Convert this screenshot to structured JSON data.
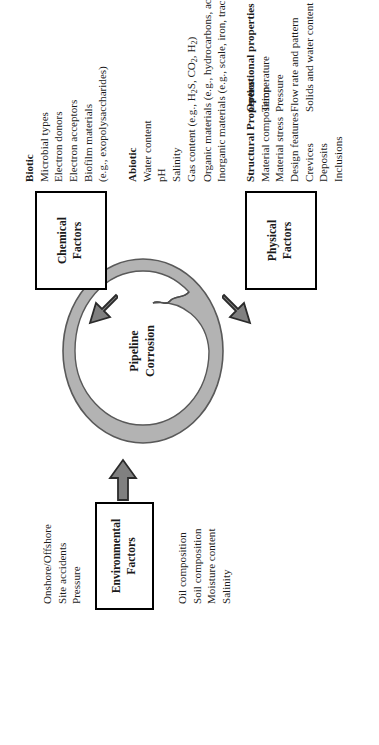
{
  "figure": {
    "center_label_line1": "Pipeline",
    "center_label_line2": "Corrosion"
  },
  "boxes": {
    "environmental": {
      "line1": "Environmental",
      "line2": "Factors"
    },
    "chemical": {
      "line1": "Chemical",
      "line2": "Factors"
    },
    "physical": {
      "line1": "Physical",
      "line2": "Factors"
    }
  },
  "lists": {
    "environment_site": {
      "items": [
        "Onshore/Offshore",
        "Site accidents",
        "Pressure"
      ]
    },
    "environment_medium": {
      "items": [
        "Oil composition",
        "Soil composition",
        "Moisture content",
        "Salinity"
      ]
    },
    "biotic": {
      "heading": "Biotic",
      "items": [
        "Microbial types",
        "Electron donors",
        "Electron acceptors",
        "Biofilm materials",
        "(e.g., exopolysaccharides)"
      ]
    },
    "abiotic": {
      "heading": "Abiotic",
      "items": [
        "Water content",
        "pH",
        "Salinity"
      ],
      "gas_prefix": "Gas content (e.g., H",
      "gas_mid": "S, CO",
      "gas_suffix": ", H",
      "gas_end": ")",
      "gas_sub1": "2",
      "gas_sub2": "2",
      "gas_sub3": "2",
      "organic": "Organic materials (e.g., hydrocarbons, acids)",
      "inorganic": "Inorganic materials (e.g., scale, iron, trace elements, etc.)"
    },
    "structural": {
      "heading": "Structural Properties",
      "items": [
        "Material composition",
        "Material stress",
        "Design features",
        "Crevices",
        "Deposits",
        "Inclusions"
      ]
    },
    "operational": {
      "heading": "Operational properties",
      "items": [
        "Temperature",
        "Pressure",
        "Flow rate and pattern",
        "Solids and water content"
      ]
    }
  },
  "colors": {
    "ring_fill": "#b3b3b3",
    "ring_stroke": "#4d4d4d",
    "arrow_fill": "#808080",
    "arrow_stroke": "#2b2b2b",
    "box_border": "#000000",
    "text": "#1a1a1a"
  },
  "icons": {
    "ring": "pipeline-ring-icon",
    "arrow_env": "arrow-environmental-icon",
    "arrow_chem": "arrow-chemical-icon",
    "arrow_phys": "arrow-physical-icon"
  }
}
